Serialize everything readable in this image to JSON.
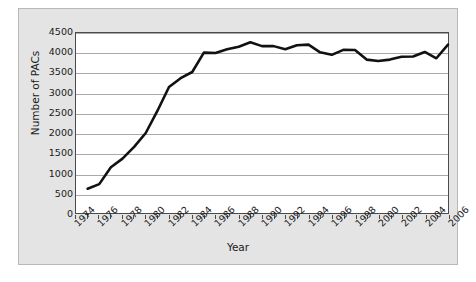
{
  "chart_data": {
    "type": "line",
    "title": "",
    "xlabel": "Year",
    "ylabel": "Number of PACs",
    "xlim": [
      1974,
      2006
    ],
    "ylim": [
      0,
      4500
    ],
    "grid": true,
    "legend": "none",
    "yticks": [
      0,
      500,
      1000,
      1500,
      2000,
      2500,
      3000,
      3500,
      4000,
      4500
    ],
    "xticks": [
      1974,
      1976,
      1978,
      1980,
      1982,
      1984,
      1986,
      1988,
      1990,
      1992,
      1994,
      1996,
      1998,
      2000,
      2002,
      2004,
      2006
    ],
    "xticks_minor": [
      1975,
      1977,
      1979,
      1981,
      1983,
      1985,
      1987,
      1989,
      1991,
      1993,
      1995,
      1997,
      1999,
      2001,
      2003,
      2005
    ],
    "series": [
      {
        "name": "Number of PACs",
        "color": "#111111",
        "x": [
          1975,
          1976,
          1977,
          1978,
          1979,
          1980,
          1981,
          1982,
          1983,
          1984,
          1985,
          1986,
          1987,
          1988,
          1989,
          1990,
          1991,
          1992,
          1993,
          1994,
          1995,
          1996,
          1997,
          1998,
          1999,
          2000,
          2001,
          2002,
          2003,
          2004,
          2005,
          2006
        ],
        "values": [
          608,
          722,
          1146,
          1360,
          1653,
          2000,
          2551,
          3149,
          3371,
          3525,
          4009,
          4000,
          4092,
          4157,
          4268,
          4172,
          4172,
          4095,
          4195,
          4210,
          4016,
          3954,
          4079,
          4075,
          3835,
          3798,
          3835,
          3907,
          3912,
          4026,
          3868,
          4210
        ]
      }
    ]
  }
}
